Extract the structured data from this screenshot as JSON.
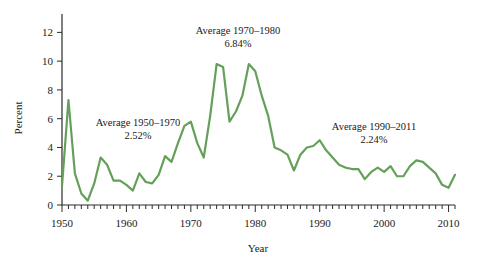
{
  "chart_data": {
    "type": "line",
    "title": "",
    "xlabel": "Year",
    "ylabel": "Percent",
    "xlim": [
      1950,
      2011
    ],
    "ylim": [
      0,
      13
    ],
    "y_ticks": [
      0,
      2,
      4,
      6,
      8,
      10,
      12
    ],
    "x_ticks": [
      1950,
      1960,
      1970,
      1980,
      1990,
      2000,
      2010
    ],
    "x_minor_tick_step": 1,
    "grid": false,
    "legend": "none",
    "line_color": "#64a05a",
    "line_width": 2.2,
    "series": [
      {
        "name": "Inflation rate",
        "x": [
          1950,
          1951,
          1952,
          1953,
          1954,
          1955,
          1956,
          1957,
          1958,
          1959,
          1960,
          1961,
          1962,
          1963,
          1964,
          1965,
          1966,
          1967,
          1968,
          1969,
          1970,
          1971,
          1972,
          1973,
          1974,
          1975,
          1976,
          1977,
          1978,
          1979,
          1980,
          1981,
          1982,
          1983,
          1984,
          1985,
          1986,
          1987,
          1988,
          1989,
          1990,
          1991,
          1992,
          1993,
          1994,
          1995,
          1996,
          1997,
          1998,
          1999,
          2000,
          2001,
          2002,
          2003,
          2004,
          2005,
          2006,
          2007,
          2008,
          2009,
          2010,
          2011
        ],
        "values": [
          1.3,
          7.3,
          2.2,
          0.8,
          0.3,
          1.5,
          3.3,
          2.8,
          1.7,
          1.7,
          1.4,
          1.0,
          2.2,
          1.6,
          1.5,
          2.1,
          3.4,
          3.0,
          4.3,
          5.5,
          5.8,
          4.3,
          3.3,
          6.2,
          9.8,
          9.6,
          5.8,
          6.5,
          7.6,
          9.8,
          9.3,
          7.6,
          6.2,
          4.0,
          3.8,
          3.5,
          2.4,
          3.5,
          4.0,
          4.1,
          4.5,
          3.8,
          3.3,
          2.8,
          2.6,
          2.5,
          2.5,
          1.8,
          2.3,
          2.6,
          2.3,
          2.7,
          2.0,
          2.0,
          2.7,
          3.1,
          3.0,
          2.6,
          2.2,
          1.4,
          1.2,
          2.1
        ]
      }
    ],
    "annotations": [
      {
        "id": "avg-1950-1970",
        "line1": "Average 1950–1970",
        "line2": "2.52%",
        "x_px": 138,
        "y_px": 126
      },
      {
        "id": "avg-1970-1980",
        "line1": "Average 1970–1980",
        "line2": "6.84%",
        "x_px": 238,
        "y_px": 34
      },
      {
        "id": "avg-1990-2011",
        "line1": "Average 1990–2011",
        "line2": "2.24%",
        "x_px": 374,
        "y_px": 130
      }
    ],
    "y_tick_labels": [
      "0",
      "2",
      "4",
      "6",
      "8",
      "10",
      "12"
    ],
    "x_tick_labels": [
      "1950",
      "1960",
      "1970",
      "1980",
      "1990",
      "2000",
      "2010"
    ]
  }
}
